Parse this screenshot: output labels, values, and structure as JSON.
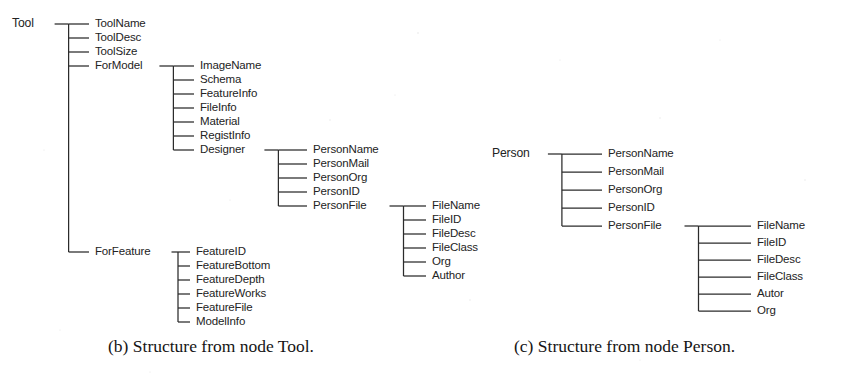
{
  "figure": {
    "background_color": "#ffffff",
    "ink_color": "#232323",
    "width": 843,
    "height": 379
  },
  "captions": {
    "b": "(b) Structure from node Tool.",
    "c": "(c) Structure from node Person."
  },
  "diagrams": [
    {
      "id": "structure-from-node-tool",
      "caption_key": "b",
      "root": {
        "label": "Tool",
        "x": 12,
        "y": 24,
        "children": [
          {
            "label": "ToolName",
            "x": 95,
            "y": 24
          },
          {
            "label": "ToolDesc",
            "x": 95,
            "y": 38
          },
          {
            "label": "ToolSize",
            "x": 95,
            "y": 52
          },
          {
            "label": "ForModel",
            "x": 95,
            "y": 66,
            "children": [
              {
                "label": "ImageName",
                "x": 200,
                "y": 66
              },
              {
                "label": "Schema",
                "x": 200,
                "y": 80
              },
              {
                "label": "FeatureInfo",
                "x": 200,
                "y": 94
              },
              {
                "label": "FileInfo",
                "x": 200,
                "y": 108
              },
              {
                "label": "Material",
                "x": 200,
                "y": 122
              },
              {
                "label": "RegistInfo",
                "x": 200,
                "y": 136
              },
              {
                "label": "Designer",
                "x": 200,
                "y": 150,
                "children": [
                  {
                    "label": "PersonName",
                    "x": 313,
                    "y": 150
                  },
                  {
                    "label": "PersonMail",
                    "x": 313,
                    "y": 164
                  },
                  {
                    "label": "PersonOrg",
                    "x": 313,
                    "y": 178
                  },
                  {
                    "label": "PersonID",
                    "x": 313,
                    "y": 192
                  },
                  {
                    "label": "PersonFile",
                    "x": 313,
                    "y": 206,
                    "children": [
                      {
                        "label": "FileName",
                        "x": 432,
                        "y": 206
                      },
                      {
                        "label": "FileID",
                        "x": 432,
                        "y": 220
                      },
                      {
                        "label": "FileDesc",
                        "x": 432,
                        "y": 234
                      },
                      {
                        "label": "FileClass",
                        "x": 432,
                        "y": 248
                      },
                      {
                        "label": "Org",
                        "x": 432,
                        "y": 262
                      },
                      {
                        "label": "Author",
                        "x": 432,
                        "y": 276
                      }
                    ]
                  }
                ]
              }
            ]
          },
          {
            "label": "ForFeature",
            "x": 95,
            "y": 252,
            "children": [
              {
                "label": "FeatureID",
                "x": 196,
                "y": 252
              },
              {
                "label": "FeatureBottom",
                "x": 196,
                "y": 266
              },
              {
                "label": "FeatureDepth",
                "x": 196,
                "y": 280
              },
              {
                "label": "FeatureWorks",
                "x": 196,
                "y": 294
              },
              {
                "label": "FeatureFile",
                "x": 196,
                "y": 308
              },
              {
                "label": "ModelInfo",
                "x": 196,
                "y": 322
              }
            ]
          }
        ]
      }
    },
    {
      "id": "structure-from-node-person",
      "caption_key": "c",
      "root": {
        "label": "Person",
        "x": 492,
        "y": 154,
        "children": [
          {
            "label": "PersonName",
            "x": 608,
            "y": 154
          },
          {
            "label": "PersonMail",
            "x": 608,
            "y": 172
          },
          {
            "label": "PersonOrg",
            "x": 608,
            "y": 190
          },
          {
            "label": "PersonID",
            "x": 608,
            "y": 208
          },
          {
            "label": "PersonFile",
            "x": 608,
            "y": 226,
            "children": [
              {
                "label": "FileName",
                "x": 757,
                "y": 226
              },
              {
                "label": "FileID",
                "x": 757,
                "y": 243
              },
              {
                "label": "FileDesc",
                "x": 757,
                "y": 260
              },
              {
                "label": "FileClass",
                "x": 757,
                "y": 277
              },
              {
                "label": "Autor",
                "x": 757,
                "y": 294
              },
              {
                "label": "Org",
                "x": 757,
                "y": 311
              }
            ]
          }
        ]
      }
    }
  ]
}
